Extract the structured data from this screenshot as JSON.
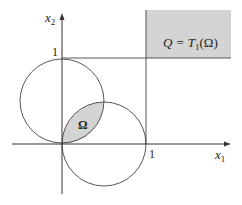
{
  "diagram": {
    "axes": {
      "x_label": "x",
      "x_label_sub": "1",
      "y_label": "x",
      "y_label_sub": "2",
      "x_tick_label": "1",
      "y_tick_label": "1"
    },
    "regions": {
      "omega_label": "Ω",
      "q_label_prefix": "Q = T",
      "q_label_sub": "1",
      "q_label_suffix": "(Ω)"
    },
    "colors": {
      "shade": "#d4d4d4",
      "stroke": "#444444",
      "background": "#ffffff"
    },
    "geometry": {
      "circle_1_center": [
        0,
        0.5
      ],
      "circle_1_radius": 0.5,
      "circle_2_center": [
        0.5,
        0
      ],
      "circle_2_radius": 0.5,
      "shaded_region_Q": "x1 >= 1, x2 >= 1"
    }
  }
}
